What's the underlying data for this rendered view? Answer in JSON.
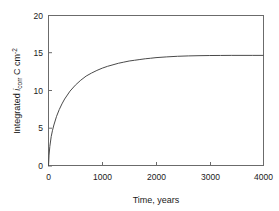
{
  "chart_data": {
    "type": "line",
    "title": "",
    "xlabel": "Time, years",
    "ylabel_parts": {
      "lead": "Integrated ",
      "symbol": "i",
      "symbol_sub": "corr",
      "units": " C cm",
      "units_sup": "-2"
    },
    "ylabel_plain": "Integrated i_corr C cm^-2",
    "xlim": [
      0,
      4000
    ],
    "ylim": [
      0,
      20
    ],
    "xticks": [
      0,
      1000,
      2000,
      3000,
      4000
    ],
    "xtick_labels": [
      "0",
      "1000",
      "2000",
      "3000",
      "4000"
    ],
    "yticks": [
      0,
      5,
      10,
      15,
      20
    ],
    "ytick_labels": [
      "0",
      "5",
      "10",
      "15",
      "20"
    ],
    "grid": false,
    "legend": null,
    "series": [
      {
        "name": "Integrated corrosion current",
        "color": "#4a4a4a",
        "plateau_value": 14.7,
        "x": [
          0,
          10,
          25,
          50,
          75,
          100,
          150,
          200,
          250,
          300,
          400,
          500,
          600,
          700,
          800,
          900,
          1000,
          1100,
          1200,
          1300,
          1400,
          1500,
          1600,
          1700,
          1800,
          1900,
          2000,
          2200,
          2400,
          2600,
          2800,
          3000,
          3200,
          3400,
          3600,
          3800,
          4000
        ],
        "y": [
          0,
          1.45,
          2.6,
          3.9,
          4.75,
          5.45,
          6.6,
          7.5,
          8.25,
          8.9,
          9.95,
          10.75,
          11.4,
          11.95,
          12.35,
          12.7,
          13.0,
          13.25,
          13.45,
          13.65,
          13.8,
          13.95,
          14.05,
          14.15,
          14.25,
          14.32,
          14.4,
          14.5,
          14.58,
          14.63,
          14.66,
          14.68,
          14.69,
          14.7,
          14.7,
          14.7,
          14.7
        ]
      }
    ]
  }
}
